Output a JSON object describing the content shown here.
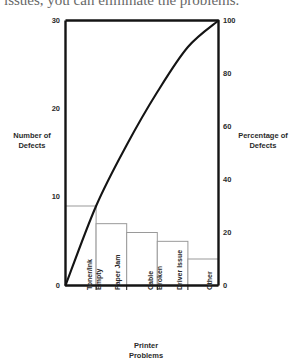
{
  "caption": {
    "text": "issues, you can eliminate the problems."
  },
  "chart_data": {
    "type": "bar",
    "title": "",
    "subtitle": "",
    "categories": [
      "Toner/Ink Empty",
      "Paper Jam",
      "Cable Broken",
      "Driver Issue",
      "Other"
    ],
    "category_lines": [
      [
        "Toner/Ink",
        "Empty"
      ],
      [
        "Paper Jam"
      ],
      [
        "Cable",
        "Broken"
      ],
      [
        "Driver Issue"
      ],
      [
        "Other"
      ]
    ],
    "values": [
      9,
      7,
      6,
      5,
      3
    ],
    "cumulative_percent": [
      30,
      53,
      73,
      90,
      100
    ],
    "series": [
      {
        "name": "Number of Defects",
        "type": "bar",
        "axis": "left",
        "values": [
          9,
          7,
          6,
          5,
          3
        ]
      },
      {
        "name": "Percentage of Defects",
        "type": "line",
        "axis": "right",
        "values": [
          30,
          53,
          73,
          90,
          100
        ]
      }
    ],
    "xlabel": "Printer Problems",
    "ylabel": "Number of Defects",
    "y2label": "Percentage of Defects",
    "ylim": [
      0,
      30
    ],
    "y2lim": [
      0,
      100
    ],
    "yticks": [
      0,
      10,
      20,
      30
    ],
    "y2ticks": [
      0,
      20,
      40,
      60,
      80,
      100
    ],
    "ytick_labels": [
      "0",
      "10",
      "20",
      "30"
    ],
    "y2tick_labels": [
      "0",
      "20",
      "40",
      "60",
      "80",
      "100"
    ],
    "grid": false,
    "legend": "none",
    "colors": {
      "bar_fill": "#ffffff",
      "bar_stroke": "#9a9a9a",
      "line": "#141414",
      "axis": "#141414",
      "text": "#2b2b2b",
      "background": "#ffffff"
    }
  }
}
